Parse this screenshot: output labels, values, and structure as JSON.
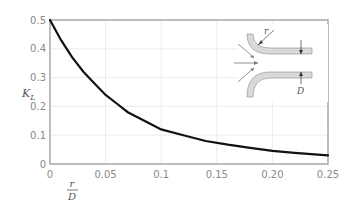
{
  "chart_data": {
    "type": "line",
    "title": "",
    "xlabel": "r/D",
    "xlabel_numerator": "r",
    "xlabel_denominator": "D",
    "ylabel": "K_L",
    "ylabel_main": "K",
    "ylabel_sub": "L",
    "xlim": [
      0,
      0.25
    ],
    "ylim": [
      0,
      0.5
    ],
    "x_ticks": [
      "0",
      "0.05",
      "0.1",
      "0.15",
      "0.20",
      "0.25"
    ],
    "y_ticks": [
      "0",
      "0.1",
      "0.2",
      "0.3",
      "0.4",
      "0.5"
    ],
    "grid": true,
    "legend": null,
    "series": [
      {
        "name": "K_L vs r/D",
        "color": "#111111",
        "x": [
          0,
          0.01,
          0.02,
          0.03,
          0.04,
          0.05,
          0.06,
          0.07,
          0.08,
          0.09,
          0.1,
          0.12,
          0.14,
          0.16,
          0.18,
          0.2,
          0.22,
          0.25
        ],
        "y": [
          0.5,
          0.43,
          0.37,
          0.32,
          0.28,
          0.24,
          0.21,
          0.18,
          0.16,
          0.14,
          0.12,
          0.1,
          0.08,
          0.067,
          0.056,
          0.046,
          0.039,
          0.03
        ]
      }
    ],
    "inset": {
      "description": "Rounded pipe entrance with radius r and diameter D",
      "labels": {
        "radius": "r",
        "diameter": "D"
      }
    }
  },
  "colors": {
    "curve": "#111111",
    "axis": "#9a9a9a",
    "grid": "#ececec",
    "pipe_fill": "#d9d9d9",
    "tick_text": "#8a8a8a"
  }
}
